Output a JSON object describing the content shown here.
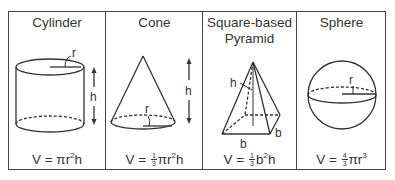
{
  "columns": [
    {
      "name": "Cylinder",
      "formula": {
        "lhs": "V",
        "eq": "=",
        "pre": "",
        "frac_num": "",
        "frac_den": "",
        "rhs": "πr",
        "exp": "2",
        "post": "h"
      },
      "labels": {
        "radius": "r",
        "height": "h"
      }
    },
    {
      "name": "Cone",
      "formula": {
        "lhs": "V",
        "eq": "=",
        "frac_num": "1",
        "frac_den": "3",
        "rhs": "πr",
        "exp": "2",
        "post": "h"
      },
      "labels": {
        "radius": "r",
        "height": "h"
      }
    },
    {
      "name_line1": "Square-based",
      "name_line2": "Pyramid",
      "formula": {
        "lhs": "V",
        "eq": "=",
        "frac_num": "1",
        "frac_den": "3",
        "rhs": "b",
        "exp": "2",
        "post": "h"
      },
      "labels": {
        "height": "h",
        "base_side_1": "b",
        "base_side_2": "b"
      }
    },
    {
      "name": "Sphere",
      "formula": {
        "lhs": "V",
        "eq": "=",
        "frac_num": "4",
        "frac_den": "3",
        "rhs": "πr",
        "exp": "3",
        "post": ""
      },
      "labels": {
        "radius": "r"
      }
    }
  ],
  "colors": {
    "line": "#333333",
    "border": "#444444",
    "background": "#ffffff"
  }
}
